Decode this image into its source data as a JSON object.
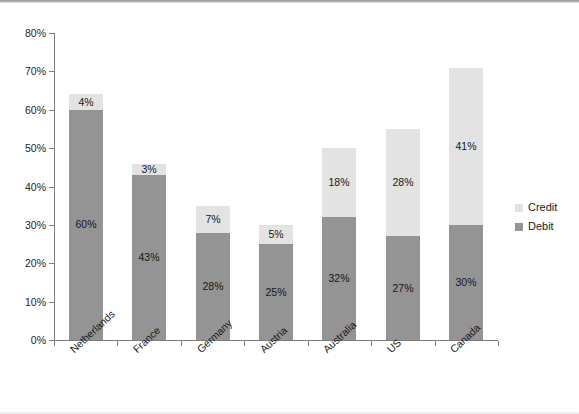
{
  "chart_data": {
    "type": "bar",
    "subtype": "stacked-bar",
    "title": "",
    "xlabel": "",
    "ylabel": "",
    "ylim": [
      0,
      80
    ],
    "y_tick_labels": [
      "0%",
      "10%",
      "20%",
      "30%",
      "40%",
      "50%",
      "60%",
      "70%",
      "80%"
    ],
    "y_tick_values": [
      0,
      10,
      20,
      30,
      40,
      50,
      60,
      70,
      80
    ],
    "grid": false,
    "legend_position": "right",
    "categories": [
      "Netherlands",
      "France",
      "Germany",
      "Austria",
      "Australia",
      "US",
      "Canada"
    ],
    "series": [
      {
        "name": "Debit",
        "color": "#949494",
        "values": [
          60,
          43,
          28,
          25,
          32,
          27,
          30
        ],
        "labels": [
          "60%",
          "43%",
          "28%",
          "25%",
          "32%",
          "27%",
          "30%"
        ]
      },
      {
        "name": "Credit",
        "color": "#e3e3e3",
        "values": [
          4,
          3,
          7,
          5,
          18,
          28,
          41
        ],
        "labels": [
          "4%",
          "3%",
          "7%",
          "5%",
          "18%",
          "28%",
          "41%"
        ]
      }
    ],
    "totals": [
      64,
      46,
      35,
      30,
      50,
      55,
      71
    ]
  },
  "legend": {
    "items": [
      {
        "label": "Credit",
        "color": "#e3e3e3"
      },
      {
        "label": "Debit",
        "color": "#949494"
      }
    ]
  },
  "colors": {
    "debit": "#949494",
    "credit": "#e3e3e3",
    "axis": "#7d7d7d",
    "text": "#1a1a1a",
    "background": "#ffffff"
  }
}
